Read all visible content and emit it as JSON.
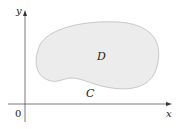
{
  "diagram": {
    "region_label": "D",
    "curve_label": "C",
    "x_axis_label": "x",
    "y_axis_label": "y",
    "origin_label": "0",
    "colors": {
      "region_fill": "#ececec",
      "region_stroke": "#c8c8c8",
      "axis": "#555555"
    }
  }
}
